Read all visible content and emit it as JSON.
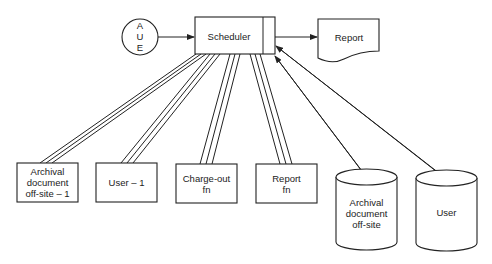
{
  "diagram": {
    "type": "flow",
    "nodes": {
      "aue": {
        "label_lines": [
          "A",
          "U",
          "E"
        ],
        "shape": "circle"
      },
      "scheduler": {
        "label": "Scheduler",
        "shape": "rectangle-with-side-bar"
      },
      "report": {
        "label": "Report",
        "shape": "document"
      },
      "archival_offsite_1": {
        "label_lines": [
          "Archival",
          "document",
          "off-site – 1"
        ],
        "shape": "rectangle"
      },
      "user_1": {
        "label": "User – 1",
        "shape": "rectangle"
      },
      "charge_out_fn": {
        "label_lines": [
          "Charge-out",
          "fn"
        ],
        "shape": "rectangle"
      },
      "report_fn": {
        "label_lines": [
          "Report",
          "fn"
        ],
        "shape": "rectangle"
      },
      "archival_offsite_db": {
        "label_lines": [
          "Archival",
          "document",
          "off-site"
        ],
        "shape": "cylinder"
      },
      "user_db": {
        "label": "User",
        "shape": "cylinder"
      }
    },
    "edges": [
      {
        "from": "aue",
        "to": "scheduler",
        "style": "arrow"
      },
      {
        "from": "scheduler",
        "to": "report",
        "style": "arrow"
      },
      {
        "from": "scheduler",
        "to": "archival_offsite_1",
        "style": "triple-line"
      },
      {
        "from": "scheduler",
        "to": "user_1",
        "style": "triple-line"
      },
      {
        "from": "scheduler",
        "to": "charge_out_fn",
        "style": "triple-line"
      },
      {
        "from": "scheduler",
        "to": "report_fn",
        "style": "triple-line"
      },
      {
        "from": "scheduler",
        "to": "archival_offsite_db",
        "style": "double-arrow"
      },
      {
        "from": "scheduler",
        "to": "user_db",
        "style": "double-arrow"
      }
    ]
  }
}
